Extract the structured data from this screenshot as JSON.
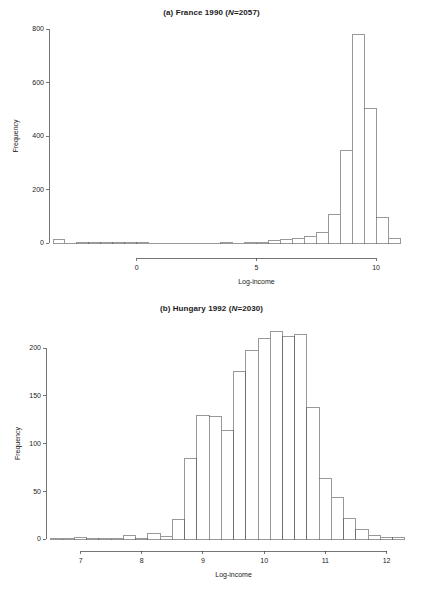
{
  "figure": {
    "width": 423,
    "height": 592,
    "background": "#ffffff",
    "ink_color": "#1a1a1a"
  },
  "panels": [
    {
      "id": "a",
      "title_prefix": "(a) France 1990 (",
      "title_italic": "N",
      "title_suffix": "=2057)"
    },
    {
      "id": "b",
      "title_prefix": "(b) Hungary 1992 (",
      "title_italic": "N",
      "title_suffix": "=2030)"
    }
  ],
  "chart_data": [
    {
      "type": "bar",
      "subtype": "histogram",
      "panel": "a",
      "title": "(a) France 1990 (N=2057)",
      "xlabel": "Log-income",
      "ylabel": "Frequency",
      "xlim": [
        -3.5,
        11.5
      ],
      "ylim": [
        0,
        800
      ],
      "xticks": [
        0,
        5,
        10
      ],
      "yticks": [
        0,
        200,
        400,
        600,
        800
      ],
      "xtick_labels": [
        "0",
        "5",
        "10"
      ],
      "ytick_labels": [
        "0",
        "200",
        "400",
        "600",
        "800"
      ],
      "grid": false,
      "legend": "none",
      "bin_width": 0.5,
      "bin_starts": [
        -3.5,
        -3.0,
        -2.5,
        -2.0,
        -1.5,
        -1.0,
        -0.5,
        0.0,
        0.5,
        1.0,
        1.5,
        2.0,
        2.5,
        3.0,
        3.5,
        4.0,
        4.5,
        5.0,
        5.5,
        6.0,
        6.5,
        7.0,
        7.5,
        8.0,
        8.5,
        9.0,
        9.5,
        10.0,
        10.5
      ],
      "values": [
        14,
        0,
        1,
        1,
        1,
        2,
        3,
        1,
        0,
        0,
        0,
        0,
        0,
        0,
        1,
        0,
        1,
        2,
        9,
        12,
        18,
        25,
        41,
        108,
        345,
        778,
        502,
        95,
        17
      ]
    },
    {
      "type": "bar",
      "subtype": "histogram",
      "panel": "b",
      "title": "(b) Hungary 1992 (N=2030)",
      "xlabel": "Log-income",
      "ylabel": "Frequency",
      "xlim": [
        6.5,
        12.4
      ],
      "ylim": [
        0,
        220
      ],
      "xticks": [
        7,
        8,
        9,
        10,
        11,
        12
      ],
      "yticks": [
        0,
        50,
        100,
        150,
        200
      ],
      "xtick_labels": [
        "7",
        "8",
        "9",
        "10",
        "11",
        "12"
      ],
      "ytick_labels": [
        "0",
        "50",
        "100",
        "150",
        "200"
      ],
      "grid": false,
      "legend": "none",
      "bin_width": 0.2,
      "bin_starts": [
        6.5,
        6.7,
        6.9,
        7.1,
        7.3,
        7.5,
        7.7,
        7.9,
        8.1,
        8.3,
        8.5,
        8.7,
        8.9,
        9.1,
        9.3,
        9.5,
        9.7,
        9.9,
        10.1,
        10.3,
        10.5,
        10.7,
        10.9,
        11.1,
        11.3,
        11.5,
        11.7,
        11.9,
        12.1
      ],
      "values": [
        1,
        1,
        2,
        1,
        1,
        1,
        4,
        1,
        6,
        3,
        20,
        84,
        129,
        128,
        114,
        176,
        197,
        210,
        217,
        212,
        214,
        138,
        63,
        44,
        21,
        10,
        4,
        2,
        2
      ]
    }
  ]
}
